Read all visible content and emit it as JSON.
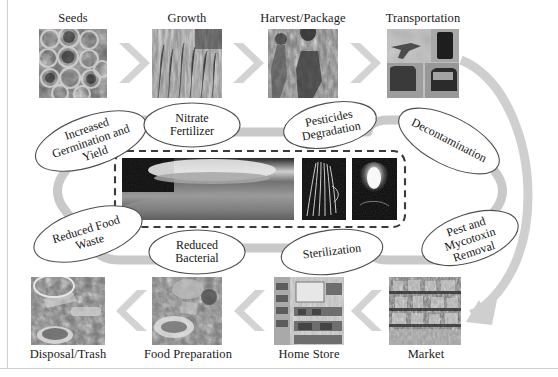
{
  "figure": {
    "background_color": "#ffffff",
    "band_color": "#c9c9c9",
    "arrow_color": "#cfcfcf",
    "ellipse_stroke": "#555555",
    "text_color": "#141414",
    "frame_color": "#cfcfcf"
  },
  "chain_top": {
    "steps": [
      {
        "caption": "Seeds",
        "icon": "seeds-photo"
      },
      {
        "caption": "Growth",
        "icon": "growth-photo"
      },
      {
        "caption": "Harvest/Package",
        "icon": "harvest-package-photo"
      },
      {
        "caption": "Transportation",
        "icon": "transportation-photo"
      }
    ]
  },
  "chain_bottom": {
    "steps": [
      {
        "caption": "Disposal/Trash",
        "icon": "disposal-trash-photo"
      },
      {
        "caption": "Food Preparation",
        "icon": "food-preparation-photo"
      },
      {
        "caption": "Home Store",
        "icon": "home-store-photo"
      },
      {
        "caption": "Market",
        "icon": "market-photo"
      }
    ]
  },
  "benefits": {
    "ellipses": [
      {
        "id": "increased-germination-and-yield",
        "line1": "Increased",
        "line2": "Germination and",
        "line3": "Yield",
        "rotation_deg": -19
      },
      {
        "id": "nitrate-fertilizer",
        "line1": "Nitrate",
        "line2": "Fertilizer",
        "line3": "",
        "rotation_deg": 0
      },
      {
        "id": "pesticides-degradation",
        "line1": "Pesticides",
        "line2": "Degradation",
        "line3": "",
        "rotation_deg": -11
      },
      {
        "id": "decontamination",
        "line1": "Decontamination",
        "line2": "",
        "line3": "",
        "rotation_deg": 27
      },
      {
        "id": "pest-and-mycotoxin-removal",
        "line1": "Pest and",
        "line2": "Mycotoxin",
        "line3": "Removal",
        "rotation_deg": -18
      },
      {
        "id": "sterilization",
        "line1": "Sterilization",
        "line2": "",
        "line3": "",
        "rotation_deg": -7
      },
      {
        "id": "reduced-bacterial",
        "line1": "Reduced",
        "line2": "Bacterial",
        "line3": "",
        "rotation_deg": 0
      },
      {
        "id": "reduced-food-waste",
        "line1": "Reduced Food",
        "line2": "Waste",
        "line3": "",
        "rotation_deg": -17
      }
    ]
  },
  "plasma_panel": {
    "border_style": "dashed",
    "images": [
      {
        "id": "plasma-jet-wide-photo"
      },
      {
        "id": "plasma-filament-photo"
      },
      {
        "id": "plasma-plume-photo"
      }
    ]
  }
}
